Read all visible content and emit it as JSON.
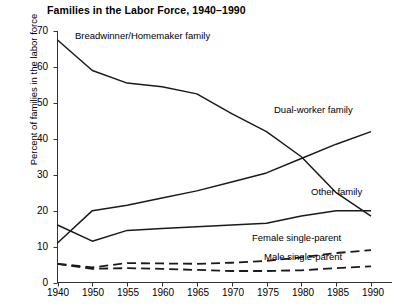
{
  "chart_data": {
    "type": "line",
    "title": "Families in the Labor Force, 1940–1990",
    "xlabel": "",
    "ylabel": "Percent of families in the labor force",
    "x": [
      1940,
      1950,
      1955,
      1960,
      1965,
      1970,
      1975,
      1980,
      1985,
      1990
    ],
    "categories": [
      "1940",
      "1950",
      "1955",
      "1960",
      "1965",
      "1970",
      "1975",
      "1980",
      "1985",
      "1990"
    ],
    "ylim": [
      0,
      70
    ],
    "yticks": [
      0,
      10,
      20,
      30,
      40,
      50,
      60,
      70
    ],
    "ytick_labels": [
      "0",
      "10",
      "20",
      "30",
      "40",
      "50",
      "60",
      "70"
    ],
    "grid": false,
    "legend": "inline-annotations",
    "series": [
      {
        "name": "Breadwinner/Homemaker family",
        "style": "solid",
        "values": [
          67.5,
          59.0,
          55.5,
          54.5,
          52.5,
          47.0,
          42.0,
          35.0,
          25.0,
          18.5
        ]
      },
      {
        "name": "Dual-worker family",
        "style": "solid",
        "values": [
          11.0,
          20.0,
          21.5,
          23.5,
          25.5,
          28.0,
          30.5,
          34.5,
          38.5,
          42.0
        ]
      },
      {
        "name": "Other family",
        "style": "solid",
        "values": [
          16.0,
          11.5,
          14.5,
          15.0,
          15.5,
          16.0,
          16.5,
          18.5,
          20.0,
          20.0
        ]
      },
      {
        "name": "Female single-parent",
        "style": "dashed",
        "values": [
          5.2,
          4.2,
          5.4,
          5.3,
          5.2,
          5.5,
          6.0,
          7.0,
          8.2,
          9.0
        ]
      },
      {
        "name": "Male single-parent",
        "style": "dashed",
        "values": [
          5.2,
          3.8,
          4.0,
          3.8,
          3.5,
          3.2,
          3.2,
          3.4,
          4.0,
          4.5
        ]
      }
    ],
    "annotations": [
      {
        "text": "Breadwinner/Homemaker family",
        "x": 75,
        "y": 30
      },
      {
        "text": "Dual-worker family",
        "x": 274,
        "y": 104
      },
      {
        "text": "Other family",
        "x": 311,
        "y": 186
      },
      {
        "text": "Female single-parent",
        "x": 252,
        "y": 232
      },
      {
        "text": "Male single-parent",
        "x": 264,
        "y": 251
      }
    ],
    "colors": {
      "line": "#1a1a1a",
      "axis": "#333333",
      "background": "#ffffff"
    }
  }
}
